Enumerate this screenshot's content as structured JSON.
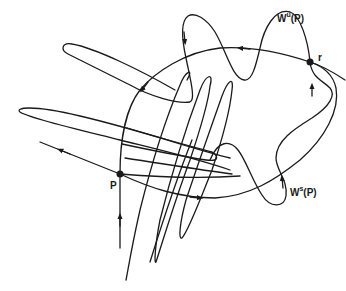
{
  "diagram": {
    "type": "homoclinic-tangle",
    "colors": {
      "stroke": "#1a1a1a",
      "background": "#ffffff"
    },
    "points": [
      {
        "id": "P",
        "label": "P",
        "x": 120,
        "y": 174
      },
      {
        "id": "r",
        "label": "r",
        "x": 310,
        "y": 62
      }
    ],
    "labels": {
      "unstable": {
        "base": "W",
        "sup": "u",
        "tail": "(P)"
      },
      "stable": {
        "base": "W",
        "sup": "s",
        "tail": "(P)"
      },
      "point_p": "P",
      "point_r": "r"
    }
  }
}
